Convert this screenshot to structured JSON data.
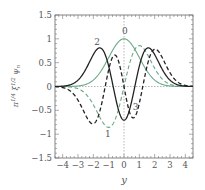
{
  "chart_data": {
    "type": "line",
    "title": "",
    "xlabel": "y",
    "ylabel": "π^{1/4} ξ^{1/2} ψ_n",
    "xlim": [
      -4.5,
      4.5
    ],
    "ylim": [
      -1.5,
      1.5
    ],
    "xticks": [
      -4,
      -3,
      -2,
      -1,
      0,
      1,
      2,
      3,
      4
    ],
    "yticks": [
      -1.5,
      -1,
      -0.5,
      0,
      0.5,
      1,
      1.5
    ],
    "ytick_labels": [
      "−1.5",
      "−1",
      "−0.5",
      "0",
      "0.5",
      "1",
      "1.5"
    ],
    "xtick_labels": [
      "−4",
      "−3",
      "−2",
      "−1",
      "0",
      "1",
      "2",
      "3",
      "4"
    ],
    "grid": false,
    "reference_lines": [
      "x=0 dotted",
      "y=0 dotted"
    ],
    "series": [
      {
        "name": "0",
        "n": 0,
        "color": "#6aa884",
        "style": "solid",
        "label_pos": [
          0.05,
          1.1
        ],
        "x": [
          -4,
          -3,
          -2,
          -1.5,
          -1,
          -0.5,
          0,
          0.5,
          1,
          1.5,
          2,
          3,
          4
        ],
        "values": [
          0.0,
          0.011,
          0.135,
          0.325,
          0.607,
          0.882,
          1.0,
          0.882,
          0.607,
          0.325,
          0.135,
          0.011,
          0.0
        ]
      },
      {
        "name": "1",
        "n": 1,
        "color": "#6aa884",
        "style": "dashed",
        "label_pos": [
          -1.05,
          -1.05
        ],
        "x": [
          -4,
          -3,
          -2,
          -1.5,
          -1,
          -0.5,
          0,
          0.5,
          1,
          1.5,
          2,
          3,
          4
        ],
        "values": [
          0.0,
          -0.047,
          -0.383,
          -0.689,
          -0.858,
          -0.624,
          0.0,
          0.624,
          0.858,
          0.689,
          0.383,
          0.047,
          0.0
        ]
      },
      {
        "name": "2",
        "n": 2,
        "color": "#222222",
        "style": "solid",
        "label_pos": [
          -1.75,
          0.88
        ],
        "x": [
          -4,
          -3,
          -2,
          -1.5,
          -1,
          -0.5,
          0,
          0.5,
          1,
          1.5,
          2,
          3,
          4
        ],
        "values": [
          0.0,
          0.132,
          0.667,
          0.804,
          0.429,
          -0.312,
          -0.707,
          -0.312,
          0.429,
          0.804,
          0.667,
          0.132,
          0.0
        ]
      },
      {
        "name": "3",
        "n": 3,
        "color": "#222222",
        "style": "dashed",
        "label_pos": [
          0.75,
          -0.5
        ],
        "x": [
          -4,
          -3,
          -2,
          -1.5,
          -1,
          -0.5,
          0,
          0.5,
          1,
          1.5,
          2,
          3,
          4
        ],
        "values": [
          0.0,
          -0.245,
          -0.625,
          -0.0,
          0.35,
          0.509,
          0.0,
          -0.509,
          -0.35,
          0.0,
          0.625,
          0.245,
          0.0
        ]
      }
    ]
  }
}
